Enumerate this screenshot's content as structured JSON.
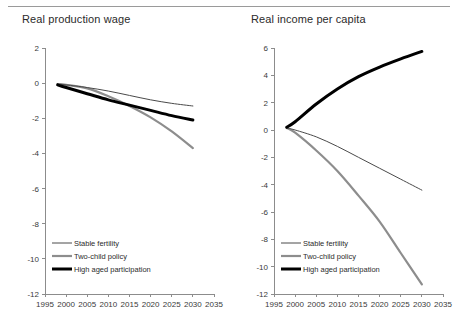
{
  "figure": {
    "panels": [
      {
        "title": "Real production wage",
        "xlabel": "",
        "ylabel": ""
      },
      {
        "title": "Real income per capita",
        "xlabel": "",
        "ylabel": ""
      }
    ],
    "legend": {
      "items": [
        {
          "label": "Stable fertility",
          "color": "#4a4a4a",
          "width": 1.0
        },
        {
          "label": "Two-child policy",
          "color": "#8d8d8d",
          "width": 2.2
        },
        {
          "label": "High aged participation",
          "color": "#000000",
          "width": 3.0
        }
      ]
    }
  },
  "chart_data": [
    {
      "type": "line",
      "title": "Real production wage",
      "xlabel": "",
      "ylabel": "",
      "xlim": [
        1995,
        2035
      ],
      "ylim": [
        -12,
        2
      ],
      "xticks": [
        1995,
        2000,
        2005,
        2010,
        2015,
        2020,
        2025,
        2030,
        2035
      ],
      "yticks": [
        2,
        0,
        -2,
        -4,
        -6,
        -8,
        -10,
        -12
      ],
      "grid": false,
      "legend_position": "lower-left",
      "x": [
        1998,
        2000,
        2005,
        2010,
        2015,
        2020,
        2025,
        2030
      ],
      "series": [
        {
          "name": "Stable fertility",
          "color": "#4a4a4a",
          "values": [
            -0.05,
            -0.1,
            -0.25,
            -0.45,
            -0.7,
            -0.95,
            -1.15,
            -1.3
          ]
        },
        {
          "name": "Two-child policy",
          "color": "#8d8d8d",
          "values": [
            -0.05,
            -0.1,
            -0.3,
            -0.75,
            -1.3,
            -1.95,
            -2.75,
            -3.7
          ]
        },
        {
          "name": "High aged participation",
          "color": "#000000",
          "values": [
            -0.1,
            -0.25,
            -0.6,
            -0.95,
            -1.25,
            -1.55,
            -1.85,
            -2.1
          ]
        }
      ]
    },
    {
      "type": "line",
      "title": "Real income per capita",
      "xlabel": "",
      "ylabel": "",
      "xlim": [
        1995,
        2035
      ],
      "ylim": [
        -12,
        6
      ],
      "xticks": [
        1995,
        2000,
        2005,
        2010,
        2015,
        2020,
        2025,
        2030,
        2035
      ],
      "yticks": [
        6,
        4,
        2,
        0,
        -2,
        -4,
        -6,
        -8,
        -10,
        -12
      ],
      "grid": false,
      "legend_position": "lower-left",
      "x": [
        1998,
        2000,
        2005,
        2010,
        2015,
        2020,
        2025,
        2030
      ],
      "series": [
        {
          "name": "Stable fertility",
          "color": "#4a4a4a",
          "values": [
            0.15,
            0.0,
            -0.5,
            -1.2,
            -2.0,
            -2.8,
            -3.6,
            -4.4
          ]
        },
        {
          "name": "Two-child policy",
          "color": "#8d8d8d",
          "values": [
            0.15,
            -0.2,
            -1.5,
            -3.0,
            -4.8,
            -6.7,
            -9.0,
            -11.3
          ]
        },
        {
          "name": "High aged participation",
          "color": "#000000",
          "values": [
            0.2,
            0.6,
            1.9,
            3.0,
            3.9,
            4.6,
            5.2,
            5.75
          ]
        }
      ]
    }
  ]
}
